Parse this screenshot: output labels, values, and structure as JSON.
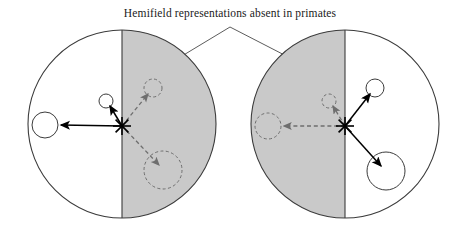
{
  "figure": {
    "caption": "Hemifield representations absent in primates",
    "background_color": "#ffffff",
    "outline_color": "#3b3b3b",
    "shaded_half_color": "#c9c9c9",
    "solid_arrow_color": "#000000",
    "dashed_arrow_color": "#6e6e6e",
    "leader_line_color": "#4a4a4a"
  },
  "diagrams": [
    {
      "id": "left-visual-field",
      "name": "left-hemifield-diagram",
      "center": {
        "x": 122,
        "y": 124
      },
      "radius": 94,
      "shaded_side": "right",
      "fixation_marker": {
        "x": 122,
        "y": 126,
        "symbol": "asterisk-cross"
      },
      "targets": [
        {
          "name": "left-solid-target",
          "style": "solid",
          "circle": {
            "x": 45,
            "y": 125,
            "r": 13
          },
          "arrow_from": {
            "x": 122,
            "y": 126
          },
          "arrow_to": {
            "x": 59,
            "y": 125
          }
        },
        {
          "name": "upper-left-solid-target",
          "style": "solid",
          "circle": {
            "x": 106,
            "y": 101,
            "r": 7
          },
          "arrow_from": {
            "x": 122,
            "y": 126
          },
          "arrow_to": {
            "x": 110,
            "y": 106
          }
        },
        {
          "name": "upper-right-dashed-target",
          "style": "dashed",
          "circle": {
            "x": 153,
            "y": 88,
            "r": 9
          },
          "arrow_from": {
            "x": 122,
            "y": 126
          },
          "arrow_to": {
            "x": 148,
            "y": 94
          }
        },
        {
          "name": "lower-right-dashed-target",
          "style": "dashed",
          "circle": {
            "x": 163,
            "y": 170,
            "r": 19
          },
          "arrow_from": {
            "x": 122,
            "y": 126
          },
          "arrow_to": {
            "x": 159,
            "y": 165
          }
        }
      ]
    },
    {
      "id": "right-visual-field",
      "name": "right-hemifield-diagram",
      "center": {
        "x": 345,
        "y": 124
      },
      "radius": 94,
      "shaded_side": "left",
      "fixation_marker": {
        "x": 345,
        "y": 126,
        "symbol": "asterisk-cross"
      },
      "targets": [
        {
          "name": "left-dashed-target",
          "style": "dashed",
          "circle": {
            "x": 268,
            "y": 126,
            "r": 13
          },
          "arrow_from": {
            "x": 345,
            "y": 126
          },
          "arrow_to": {
            "x": 282,
            "y": 126
          }
        },
        {
          "name": "upper-left-dashed-target",
          "style": "dashed",
          "circle": {
            "x": 329,
            "y": 101,
            "r": 7
          },
          "arrow_from": {
            "x": 345,
            "y": 126
          },
          "arrow_to": {
            "x": 333,
            "y": 106
          }
        },
        {
          "name": "upper-right-solid-target",
          "style": "solid",
          "circle": {
            "x": 375,
            "y": 88,
            "r": 9
          },
          "arrow_from": {
            "x": 345,
            "y": 126
          },
          "arrow_to": {
            "x": 370,
            "y": 94
          }
        },
        {
          "name": "lower-right-solid-target",
          "style": "solid",
          "circle": {
            "x": 386,
            "y": 171,
            "r": 19
          },
          "arrow_from": {
            "x": 345,
            "y": 126
          },
          "arrow_to": {
            "x": 381,
            "y": 166
          }
        }
      ]
    }
  ],
  "leader_lines": {
    "apex": {
      "x": 230,
      "y": 27
    },
    "left_end": {
      "x": 172,
      "y": 62
    },
    "right_end": {
      "x": 298,
      "y": 62
    }
  },
  "caption_position": {
    "x": 230,
    "y": 17
  }
}
